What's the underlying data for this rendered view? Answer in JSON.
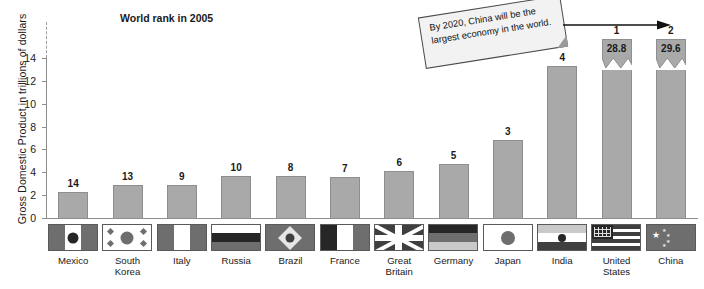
{
  "chart_data": {
    "type": "bar",
    "title": "World rank in 2005",
    "xlabel": "",
    "ylabel": "Gross Domestic Product in trillions of dollars",
    "ylim": [
      0,
      14
    ],
    "yticks": [
      0,
      2,
      4,
      6,
      8,
      10,
      12,
      14
    ],
    "axis_break": true,
    "grid": false,
    "legend": "none",
    "categories": [
      "Mexico",
      "South\nKorea",
      "Italy",
      "Russia",
      "Brazil",
      "France",
      "Great\nBritain",
      "Germany",
      "Japan",
      "India",
      "United\nStates",
      "China"
    ],
    "values": [
      2.4,
      3.0,
      3.0,
      3.8,
      3.8,
      3.7,
      4.2,
      4.8,
      6.9,
      13.4,
      28.8,
      29.6
    ],
    "rank_labels": [
      "14",
      "13",
      "9",
      "10",
      "8",
      "7",
      "6",
      "5",
      "3",
      "4",
      "1",
      "2"
    ],
    "value_labels_inside": [
      "",
      "",
      "",
      "",
      "",
      "",
      "",
      "",
      "",
      "",
      "28.8",
      "29.6"
    ],
    "broken_bars": [
      "United\nStates",
      "China"
    ],
    "annotation": "By 2020, China will be the largest economy in the world."
  },
  "chart": {
    "title": "World rank in 2005",
    "ylabel": "Gross Domestic Product in trillions of dollars",
    "yticks": [
      "14",
      "12",
      "10",
      "8",
      "6",
      "4",
      "2",
      "0"
    ],
    "bar_color": "#a9a9a9",
    "bar_border_color": "#8e8e8e",
    "axis_color": "#8d8d8d"
  },
  "annotation": {
    "text": "By 2020, China will be the largest economy in the world."
  },
  "bars": [
    {
      "country": "Mexico",
      "rank": "14",
      "value": 2.4,
      "inside": "",
      "broken": false
    },
    {
      "country": "South\nKorea",
      "rank": "13",
      "value": 3.0,
      "inside": "",
      "broken": false
    },
    {
      "country": "Italy",
      "rank": "9",
      "value": 3.0,
      "inside": "",
      "broken": false
    },
    {
      "country": "Russia",
      "rank": "10",
      "value": 3.8,
      "inside": "",
      "broken": false
    },
    {
      "country": "Brazil",
      "rank": "8",
      "value": 3.8,
      "inside": "",
      "broken": false
    },
    {
      "country": "France",
      "rank": "7",
      "value": 3.7,
      "inside": "",
      "broken": false
    },
    {
      "country": "Great\nBritain",
      "rank": "6",
      "value": 4.2,
      "inside": "",
      "broken": false
    },
    {
      "country": "Germany",
      "rank": "5",
      "value": 4.8,
      "inside": "",
      "broken": false
    },
    {
      "country": "Japan",
      "rank": "3",
      "value": 6.9,
      "inside": "",
      "broken": false
    },
    {
      "country": "India",
      "rank": "4",
      "value": 13.4,
      "inside": "",
      "broken": false
    },
    {
      "country": "United\nStates",
      "rank": "1",
      "value": 28.8,
      "inside": "28.8",
      "broken": true
    },
    {
      "country": "China",
      "rank": "2",
      "value": 29.6,
      "inside": "29.6",
      "broken": true
    }
  ],
  "flags": [
    {
      "name": "mexico-flag",
      "country": "Mexico"
    },
    {
      "name": "south-korea-flag",
      "country": "South Korea"
    },
    {
      "name": "italy-flag",
      "country": "Italy"
    },
    {
      "name": "russia-flag",
      "country": "Russia"
    },
    {
      "name": "brazil-flag",
      "country": "Brazil"
    },
    {
      "name": "france-flag",
      "country": "France"
    },
    {
      "name": "great-britain-flag",
      "country": "Great Britain"
    },
    {
      "name": "germany-flag",
      "country": "Germany"
    },
    {
      "name": "japan-flag",
      "country": "Japan"
    },
    {
      "name": "india-flag",
      "country": "India"
    },
    {
      "name": "united-states-flag",
      "country": "United States"
    },
    {
      "name": "china-flag",
      "country": "China"
    }
  ]
}
